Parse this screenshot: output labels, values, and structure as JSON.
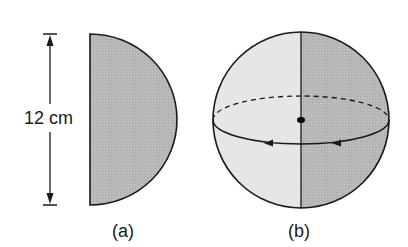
{
  "figure_a": {
    "label": "(a)",
    "dimension_label": "12 cm",
    "shape": "semicircle",
    "fill_color": "#b8b8b8"
  },
  "figure_b": {
    "label": "(b)",
    "shape": "sphere",
    "left_fill_color": "#e6e6e6",
    "right_fill_color": "#b8b8b8",
    "center_dot": true,
    "equator_arrows": 2
  },
  "colors": {
    "stroke": "#1a1a1a",
    "background": "#ffffff"
  }
}
